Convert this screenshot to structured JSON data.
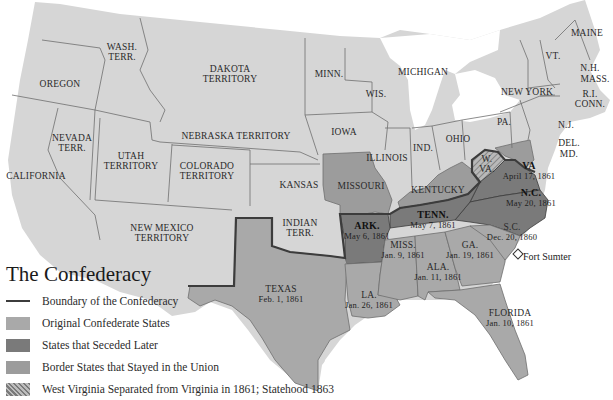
{
  "title": "The Confederacy",
  "colors": {
    "union": "#d6d6d6",
    "original_confederate": "#a9a9a9",
    "seceded_later": "#7a7a7a",
    "border_states": "#9c9c9c",
    "west_virginia_hatch": "#8a8a8a",
    "boundary": "#3c3c3c",
    "state_lines": "#6e6e6e",
    "water": "#ffffff"
  },
  "legend": {
    "items": [
      {
        "type": "line",
        "label": "Boundary of the Confederacy"
      },
      {
        "type": "swatch",
        "key": "original_confederate",
        "label": "Original Confederate States"
      },
      {
        "type": "swatch",
        "key": "seceded_later",
        "label": "States that Seceded Later"
      },
      {
        "type": "swatch",
        "key": "border_states",
        "label": "Border States that Stayed in the Union"
      },
      {
        "type": "hatch",
        "key": "west_virginia_hatch",
        "label": "West Virginia Separated from Virginia in 1861; Statehood 1863"
      }
    ]
  },
  "regions": {
    "union": [
      {
        "name": "WASH.",
        "name2": "TERR."
      },
      {
        "name": "OREGON"
      },
      {
        "name": "CALIFORNIA"
      },
      {
        "name": "NEVADA",
        "name2": "TERR."
      },
      {
        "name": "UTAH",
        "name2": "TERRITORY"
      },
      {
        "name": "DAKOTA",
        "name2": "TERRITORY"
      },
      {
        "name": "NEBRASKA TERRITORY"
      },
      {
        "name": "COLORADO",
        "name2": "TERRITORY"
      },
      {
        "name": "NEW MEXICO",
        "name2": "TERRITORY"
      },
      {
        "name": "KANSAS"
      },
      {
        "name": "INDIAN",
        "name2": "TERR."
      },
      {
        "name": "MINN."
      },
      {
        "name": "WIS."
      },
      {
        "name": "MICHIGAN"
      },
      {
        "name": "IOWA"
      },
      {
        "name": "ILLINOIS"
      },
      {
        "name": "IND."
      },
      {
        "name": "OHIO"
      },
      {
        "name": "PA."
      },
      {
        "name": "NEW YORK"
      },
      {
        "name": "N.J."
      },
      {
        "name": "VT."
      },
      {
        "name": "N.H."
      },
      {
        "name": "MASS."
      },
      {
        "name": "R.I."
      },
      {
        "name": "CONN."
      },
      {
        "name": "MAINE"
      }
    ],
    "border": [
      {
        "name": "MISSOURI"
      },
      {
        "name": "KENTUCKY"
      },
      {
        "name": "DEL."
      },
      {
        "name": "MD."
      }
    ],
    "west_virginia": {
      "name": "W.",
      "name2": "VA."
    },
    "seceded_later": [
      {
        "name": "VA",
        "date": "April 17, 1861"
      },
      {
        "name": "N.C.",
        "date": "May 20, 1861"
      },
      {
        "name": "TENN.",
        "date": "May 7, 1861"
      },
      {
        "name": "ARK.",
        "date": "May 6, 1861"
      }
    ],
    "original": [
      {
        "name": "S.C.",
        "date": "Dec. 20, 1860"
      },
      {
        "name": "MISS.",
        "date": "Jan. 9, 1861"
      },
      {
        "name": "FLORIDA",
        "date": "Jan. 10, 1861"
      },
      {
        "name": "ALA.",
        "date": "Jan. 11, 1861"
      },
      {
        "name": "GA.",
        "date": "Jan. 19, 1861"
      },
      {
        "name": "LA.",
        "date": "Jan. 26, 1861"
      },
      {
        "name": "TEXAS",
        "date": "Feb. 1, 1861"
      }
    ]
  },
  "markers": {
    "fort_sumter": "Fort Sumter"
  }
}
